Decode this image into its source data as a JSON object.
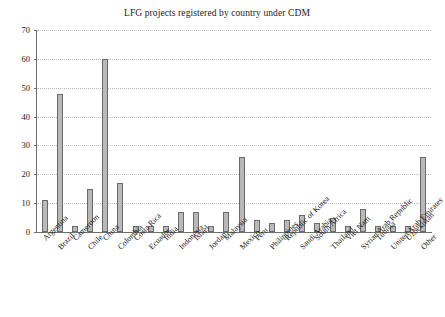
{
  "chart_data": {
    "type": "bar",
    "title": "LFG projects registered by country under CDM",
    "xlabel": "",
    "ylabel": "",
    "ylim": [
      0,
      70
    ],
    "yticks": [
      0,
      10,
      20,
      30,
      40,
      50,
      60,
      70
    ],
    "grid": true,
    "legend": null,
    "categories": [
      "Argentina",
      "Brazil",
      "Cameroon",
      "Chile",
      "China",
      "Columbia",
      "Costa Rica",
      "Ecuador",
      "India",
      "Indonesia",
      "Israel",
      "Jordan",
      "Malaysia",
      "Mexico",
      "Peru",
      "Philippines",
      "Republic of Korea",
      "Saudi Arabia",
      "South Africa",
      "Thailand",
      "Viet Nam",
      "Syrian Arab Republic",
      "Tunisia",
      "United Arab Emirates",
      "Uzbekistan",
      "Other"
    ],
    "values": [
      11,
      48,
      2,
      15,
      60,
      17,
      2,
      2,
      2,
      7,
      7,
      2,
      7,
      26,
      4,
      3,
      4,
      6,
      3,
      5,
      2,
      8,
      2,
      2,
      2,
      26
    ]
  },
  "style": {
    "bar_fill": "#b9b9b9",
    "bar_edge": "#6a6a6a",
    "grid_color": "#bdbdbd",
    "axis_color": "#6f6f6f",
    "text_color": "#1a1a1a",
    "background": "#ffffff"
  }
}
